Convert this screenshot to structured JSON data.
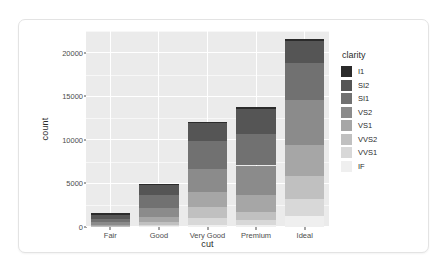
{
  "chart_data": {
    "type": "bar",
    "stacked": true,
    "title": "",
    "subtitle": "",
    "xlabel": "cut",
    "ylabel": "count",
    "categories": [
      "Fair",
      "Good",
      "Very Good",
      "Premium",
      "Ideal"
    ],
    "legend_title": "clarity",
    "legend_position": "right",
    "grid": true,
    "ylim": [
      0,
      22500
    ],
    "yticks": [
      0,
      5000,
      10000,
      15000,
      20000
    ],
    "ytick_labels": [
      "0",
      "5000",
      "10000",
      "15000",
      "20000"
    ],
    "series": [
      {
        "name": "I1",
        "color": "#2b2b2b",
        "values": [
          210,
          96,
          84,
          205,
          146
        ]
      },
      {
        "name": "SI2",
        "color": "#555555",
        "values": [
          466,
          1081,
          2100,
          2949,
          2598
        ]
      },
      {
        "name": "SI1",
        "color": "#717171",
        "values": [
          408,
          1560,
          3240,
          3575,
          4282
        ]
      },
      {
        "name": "VS2",
        "color": "#8b8b8b",
        "values": [
          261,
          978,
          2591,
          3357,
          5071
        ]
      },
      {
        "name": "VS1",
        "color": "#a6a6a6",
        "values": [
          170,
          648,
          1775,
          1989,
          3589
        ]
      },
      {
        "name": "VVS2",
        "color": "#c0c0c0",
        "values": [
          69,
          286,
          1235,
          870,
          2606
        ]
      },
      {
        "name": "VVS1",
        "color": "#d8d8d8",
        "values": [
          17,
          186,
          789,
          616,
          2047
        ]
      },
      {
        "name": "IF",
        "color": "#efefef",
        "values": [
          9,
          71,
          268,
          230,
          1212
        ]
      }
    ],
    "totals": [
      1610,
      4906,
      12082,
      13791,
      21551
    ]
  },
  "axes": {
    "y_title": "count",
    "x_title": "cut"
  },
  "legend": {
    "title": "clarity",
    "items": [
      {
        "label": "I1",
        "color": "#2b2b2b"
      },
      {
        "label": "SI2",
        "color": "#555555"
      },
      {
        "label": "SI1",
        "color": "#717171"
      },
      {
        "label": "VS2",
        "color": "#8b8b8b"
      },
      {
        "label": "VS1",
        "color": "#a6a6a6"
      },
      {
        "label": "VVS2",
        "color": "#c0c0c0"
      },
      {
        "label": "VVS1",
        "color": "#d8d8d8"
      },
      {
        "label": "IF",
        "color": "#efefef"
      }
    ]
  },
  "theme": {
    "panel_background": "#ebebeb",
    "grid_color": "#ffffff",
    "card_background": "#ffffff",
    "card_border": "#e3e3e3",
    "page_background": "#ffffff",
    "text_color": "#2b2b2b",
    "tick_color": "#4d4d4d"
  }
}
